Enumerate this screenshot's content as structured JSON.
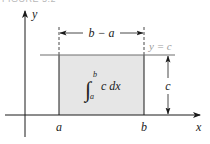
{
  "figure": {
    "caption": "FIGURE 5.2",
    "colors": {
      "axis": "#1a1a1a",
      "rect_fill": "#e6e6e6",
      "line_y_equals_c": "#6e6e6e",
      "label_y_equals_c": "#9a9a9a",
      "text": "#222222"
    },
    "axes": {
      "x_label": "x",
      "y_label": "y"
    },
    "ticks": {
      "a": "a",
      "b": "b"
    },
    "width_dimension": {
      "label": "b − a"
    },
    "height_dimension": {
      "label": "c"
    },
    "line_label": "y = c",
    "integral": {
      "upper": "b",
      "lower": "a",
      "integrand": "c dx",
      "symbol": "∫"
    }
  }
}
